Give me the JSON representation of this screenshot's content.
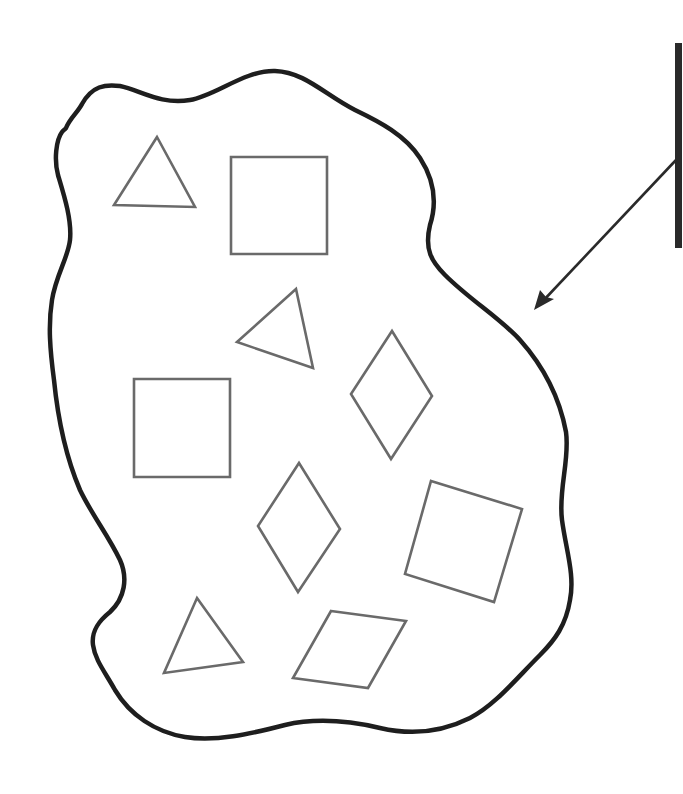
{
  "diagram": {
    "colors": {
      "background": "#ffffff",
      "boundary": "#1e1e1e",
      "shapes": "#6a6a6a",
      "pointer": "#2a2a2a"
    },
    "boundary": {
      "type": "irregular-closed-curve",
      "name": "population-boundary"
    },
    "pointer": {
      "bar": {
        "x": 678,
        "y1": 43,
        "y2": 248
      },
      "arrow": {
        "from": [
          676,
          160
        ],
        "to": [
          534,
          310
        ]
      }
    },
    "shapes": [
      {
        "kind": "triangle",
        "points": "157,137 114,205 195,207"
      },
      {
        "kind": "square",
        "points": "231,157 327,157 327,254 231,254"
      },
      {
        "kind": "triangle",
        "points": "296,289 237,342 313,368"
      },
      {
        "kind": "diamond",
        "points": "392,331 432,396 391,459 351,394"
      },
      {
        "kind": "square",
        "points": "134,379 230,379 230,477 134,477"
      },
      {
        "kind": "diamond",
        "points": "299,463 340,529 298,592 258,526"
      },
      {
        "kind": "square",
        "points": "431,481 522,509 494,602 405,574"
      },
      {
        "kind": "triangle",
        "points": "197,598 243,662 164,673"
      },
      {
        "kind": "parallelogram",
        "points": "331,611 406,621 368,688 293,678"
      }
    ],
    "counts": {
      "triangles": 3,
      "squares": 3,
      "diamonds": 2,
      "parallelograms": 1
    }
  }
}
